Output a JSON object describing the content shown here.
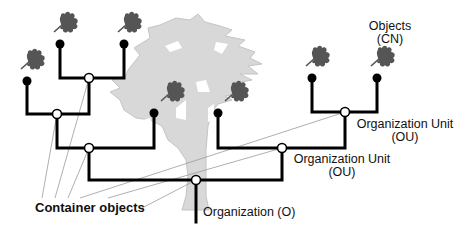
{
  "diagram": {
    "labels": {
      "objects_line1": "Objects",
      "objects_line2": "(CN)",
      "ou_upper_line1": "Organization Unit",
      "ou_upper_line2": "(OU)",
      "ou_lower_line1": "Organization Unit",
      "ou_lower_line2": "(OU)",
      "organization": "Organization (O)",
      "container_objects": "Container objects"
    },
    "colors": {
      "tree_background": "#d8d8d8",
      "tree_outline": "#bdbdbd",
      "leaf": "#555555",
      "branch_line": "#000000",
      "leader_line": "#9a9a9a",
      "container_node_fill": "#ffffff",
      "leaf_node_fill": "#000000"
    },
    "nodes": {
      "leaf_objects": 7,
      "container_objects": 6
    }
  }
}
